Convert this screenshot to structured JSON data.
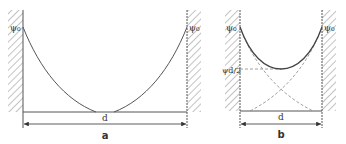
{
  "figure": {
    "panels": [
      {
        "id": "a",
        "caption": "a",
        "left_label": "ψ₀",
        "right_label": "ψ₀",
        "dimension_label": "d",
        "description": "Two separate decaying potential curves from each wall reaching zero before the midplane (non-overlapping double layers)"
      },
      {
        "id": "b",
        "caption": "b",
        "left_label": "ψ₀",
        "right_label": "ψ₀",
        "mid_label": "ψd/2",
        "dimension_label": "d",
        "description": "Overlapping double layers: dashed individual decay curves from each wall, solid combined curve with minimum ψd/2 at midplane"
      }
    ],
    "colors": {
      "line": "#555555",
      "hatch": "#9a9a9a",
      "dashed": "#888888",
      "text": "#333333"
    }
  }
}
